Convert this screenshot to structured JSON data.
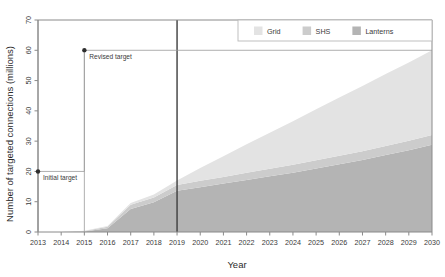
{
  "chart_data": {
    "type": "area",
    "title": "",
    "xlabel": "Year",
    "ylabel": "Number of targeted connections (millions)",
    "stacked": true,
    "grid": false,
    "legend_position": "top-right",
    "xlim": [
      2013,
      2030
    ],
    "ylim": [
      0,
      70
    ],
    "yticks": [
      0,
      10,
      20,
      30,
      40,
      50,
      60,
      70
    ],
    "categories": [
      2013,
      2014,
      2015,
      2016,
      2017,
      2018,
      2019,
      2020,
      2021,
      2022,
      2023,
      2024,
      2025,
      2026,
      2027,
      2028,
      2029,
      2030
    ],
    "xticklabels": [
      "2013",
      "2014",
      "2015",
      "2016",
      "2017",
      "2018",
      "2019",
      "2020",
      "2021",
      "2022",
      "2023",
      "2024",
      "2025",
      "2026",
      "2027",
      "2028",
      "2029",
      "2030"
    ],
    "series": [
      {
        "name": "Lanterns",
        "color": "#b4b4b4",
        "values": [
          0,
          0,
          0.2,
          1.2,
          7.6,
          9.8,
          13.6,
          14.8,
          16.0,
          17.2,
          18.4,
          19.6,
          21.0,
          22.4,
          23.8,
          25.4,
          27.0,
          28.8
        ]
      },
      {
        "name": "SHS",
        "color": "#cccccc",
        "values": [
          0,
          0,
          0.1,
          0.5,
          1.4,
          1.6,
          1.9,
          2.1,
          2.2,
          2.4,
          2.5,
          2.6,
          2.7,
          2.8,
          2.9,
          3.0,
          3.1,
          3.2
        ]
      },
      {
        "name": "Grid",
        "color": "#e3e3e3",
        "values": [
          0,
          0,
          0.1,
          0.3,
          0.6,
          1.0,
          1.5,
          4.2,
          6.8,
          9.4,
          11.9,
          14.4,
          16.8,
          19.2,
          21.5,
          23.8,
          25.9,
          28.0
        ]
      }
    ],
    "totals": [
      0,
      0,
      0.4,
      2.0,
      9.6,
      12.4,
      17.0,
      21.1,
      25.0,
      29.0,
      32.8,
      36.6,
      40.5,
      44.4,
      48.2,
      52.2,
      56.0,
      60.0
    ],
    "reference_line": {
      "name": "current-year-line",
      "x": 2019,
      "color": "#3d3d3d"
    },
    "annotations": [
      {
        "name": "initial-target",
        "label": "Initial target",
        "x": 2013,
        "y": 20,
        "leader_to_x": 2015
      },
      {
        "name": "revised-target",
        "label": "Revised target",
        "x": 2015,
        "y": 60,
        "leader_to_x": 2030
      }
    ]
  },
  "legend": {
    "items": [
      {
        "label": "Grid",
        "color": "#e3e3e3"
      },
      {
        "label": "SHS",
        "color": "#cccccc"
      },
      {
        "label": "Lanterns",
        "color": "#b4b4b4"
      }
    ]
  }
}
